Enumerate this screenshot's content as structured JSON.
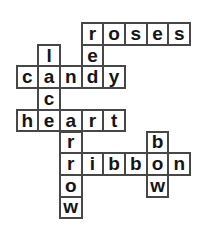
{
  "puzzle": {
    "type": "crossword",
    "grid": {
      "rows": 9,
      "cols": 8,
      "cell_size": 21.7,
      "origin_x": 15.5,
      "origin_y": 22
    },
    "words": {
      "across": [
        {
          "word": "roses",
          "row": 0,
          "col": 3
        },
        {
          "word": "candy",
          "row": 2,
          "col": 0
        },
        {
          "word": "heart",
          "row": 4,
          "col": 0
        },
        {
          "word": "ribbon",
          "row": 6,
          "col": 2
        }
      ],
      "down": [
        {
          "word": "red",
          "row": 0,
          "col": 3
        },
        {
          "word": "lace",
          "row": 1,
          "col": 1
        },
        {
          "word": "arrow",
          "row": 4,
          "col": 2
        },
        {
          "word": "bow",
          "row": 5,
          "col": 6
        }
      ]
    },
    "cells": [
      {
        "r": 0,
        "c": 3,
        "ch": "r"
      },
      {
        "r": 0,
        "c": 4,
        "ch": "o"
      },
      {
        "r": 0,
        "c": 5,
        "ch": "s"
      },
      {
        "r": 0,
        "c": 6,
        "ch": "e"
      },
      {
        "r": 0,
        "c": 7,
        "ch": "s"
      },
      {
        "r": 1,
        "c": 1,
        "ch": "l"
      },
      {
        "r": 1,
        "c": 3,
        "ch": "e"
      },
      {
        "r": 2,
        "c": 0,
        "ch": "c"
      },
      {
        "r": 2,
        "c": 1,
        "ch": "a"
      },
      {
        "r": 2,
        "c": 2,
        "ch": "n"
      },
      {
        "r": 2,
        "c": 3,
        "ch": "d"
      },
      {
        "r": 2,
        "c": 4,
        "ch": "y"
      },
      {
        "r": 3,
        "c": 1,
        "ch": "c"
      },
      {
        "r": 4,
        "c": 0,
        "ch": "h"
      },
      {
        "r": 4,
        "c": 1,
        "ch": "e"
      },
      {
        "r": 4,
        "c": 2,
        "ch": "a"
      },
      {
        "r": 4,
        "c": 3,
        "ch": "r"
      },
      {
        "r": 4,
        "c": 4,
        "ch": "t"
      },
      {
        "r": 5,
        "c": 2,
        "ch": "r"
      },
      {
        "r": 5,
        "c": 6,
        "ch": "b"
      },
      {
        "r": 6,
        "c": 2,
        "ch": "r"
      },
      {
        "r": 6,
        "c": 3,
        "ch": "i"
      },
      {
        "r": 6,
        "c": 4,
        "ch": "b"
      },
      {
        "r": 6,
        "c": 5,
        "ch": "b"
      },
      {
        "r": 6,
        "c": 6,
        "ch": "o"
      },
      {
        "r": 6,
        "c": 7,
        "ch": "n"
      },
      {
        "r": 7,
        "c": 2,
        "ch": "o"
      },
      {
        "r": 7,
        "c": 6,
        "ch": "w"
      },
      {
        "r": 8,
        "c": 2,
        "ch": "w"
      }
    ]
  },
  "colors": {
    "background": "#ffffff",
    "cell_fill": "#ffffff",
    "cell_border": "#474747",
    "letter": "#151515"
  }
}
